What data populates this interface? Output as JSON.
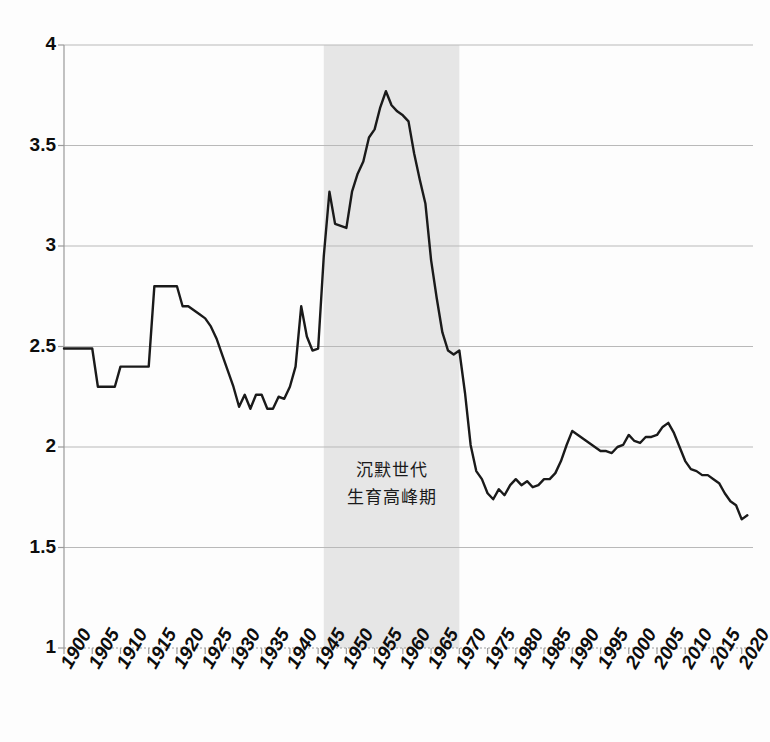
{
  "chart_data": {
    "type": "line",
    "title": "",
    "subtitle": "",
    "xlabel": "",
    "ylabel": "",
    "xlim": [
      1900,
      2022
    ],
    "ylim": [
      1,
      4
    ],
    "ytick_values": [
      1,
      1.5,
      2,
      2.5,
      3,
      3.5,
      4
    ],
    "ytick_labels": [
      "1",
      "1.5",
      "2",
      "2.5",
      "3",
      "3.5",
      "4"
    ],
    "xtick_values": [
      1900,
      1905,
      1910,
      1915,
      1920,
      1925,
      1930,
      1935,
      1940,
      1945,
      1950,
      1955,
      1960,
      1965,
      1970,
      1975,
      1980,
      1985,
      1990,
      1995,
      2000,
      2005,
      2010,
      2015,
      2020
    ],
    "xtick_labels": [
      "1900",
      "1905",
      "1910",
      "1915",
      "1920",
      "1925",
      "1930",
      "1935",
      "1940",
      "1945",
      "1950",
      "1955",
      "1960",
      "1965",
      "1970",
      "1975",
      "1980",
      "1985",
      "1990",
      "1995",
      "2000",
      "2005",
      "2010",
      "2015",
      "2020"
    ],
    "grid": {
      "horizontal": true,
      "vertical": false
    },
    "legend": {
      "show": false,
      "position": "none"
    },
    "line_color": "#1a1a1a",
    "line_width": 2.4,
    "grid_color": "#b9b9b9",
    "axis_color": "#9a9a9a",
    "background_color": "#fdfdfd",
    "shaded_band": {
      "label_lines": [
        "沉默世代",
        "生育高峰期"
      ],
      "x_start": 1946,
      "x_end": 1970,
      "fill_color": "#e6e6e6"
    },
    "series": [
      {
        "name": "total-fertility-rate",
        "x": [
          1900,
          1901,
          1902,
          1903,
          1904,
          1905,
          1906,
          1907,
          1908,
          1909,
          1910,
          1911,
          1912,
          1913,
          1914,
          1915,
          1916,
          1917,
          1918,
          1919,
          1920,
          1921,
          1922,
          1923,
          1924,
          1925,
          1926,
          1927,
          1928,
          1929,
          1930,
          1931,
          1932,
          1933,
          1934,
          1935,
          1936,
          1937,
          1938,
          1939,
          1940,
          1941,
          1942,
          1943,
          1944,
          1945,
          1946,
          1947,
          1948,
          1949,
          1950,
          1951,
          1952,
          1953,
          1954,
          1955,
          1956,
          1957,
          1958,
          1959,
          1960,
          1961,
          1962,
          1963,
          1964,
          1965,
          1966,
          1967,
          1968,
          1969,
          1970,
          1971,
          1972,
          1973,
          1974,
          1975,
          1976,
          1977,
          1978,
          1979,
          1980,
          1981,
          1982,
          1983,
          1984,
          1985,
          1986,
          1987,
          1988,
          1989,
          1990,
          1991,
          1992,
          1993,
          1994,
          1995,
          1996,
          1997,
          1998,
          1999,
          2000,
          2001,
          2002,
          2003,
          2004,
          2005,
          2006,
          2007,
          2008,
          2009,
          2010,
          2011,
          2012,
          2013,
          2014,
          2015,
          2016,
          2017,
          2018,
          2019,
          2020,
          2021
        ],
        "y": [
          2.49,
          2.49,
          2.49,
          2.49,
          2.49,
          2.49,
          2.3,
          2.3,
          2.3,
          2.3,
          2.4,
          2.4,
          2.4,
          2.4,
          2.4,
          2.4,
          2.8,
          2.8,
          2.8,
          2.8,
          2.8,
          2.7,
          2.7,
          2.68,
          2.66,
          2.64,
          2.6,
          2.54,
          2.46,
          2.38,
          2.3,
          2.2,
          2.26,
          2.19,
          2.26,
          2.26,
          2.19,
          2.19,
          2.25,
          2.24,
          2.3,
          2.4,
          2.7,
          2.55,
          2.48,
          2.49,
          2.95,
          3.27,
          3.11,
          3.1,
          3.09,
          3.27,
          3.36,
          3.42,
          3.54,
          3.58,
          3.69,
          3.77,
          3.7,
          3.67,
          3.65,
          3.62,
          3.46,
          3.33,
          3.21,
          2.93,
          2.74,
          2.57,
          2.48,
          2.46,
          2.48,
          2.27,
          2.01,
          1.88,
          1.84,
          1.77,
          1.74,
          1.79,
          1.76,
          1.81,
          1.84,
          1.81,
          1.83,
          1.8,
          1.81,
          1.84,
          1.84,
          1.87,
          1.93,
          2.01,
          2.08,
          2.06,
          2.04,
          2.02,
          2.0,
          1.98,
          1.98,
          1.97,
          2.0,
          2.01,
          2.06,
          2.03,
          2.02,
          2.05,
          2.05,
          2.06,
          2.1,
          2.12,
          2.07,
          2.0,
          1.93,
          1.89,
          1.88,
          1.86,
          1.86,
          1.84,
          1.82,
          1.77,
          1.73,
          1.71,
          1.64,
          1.66
        ]
      }
    ],
    "annotations": [
      {
        "name": "silent-generation-baby-boom-label",
        "lines": [
          "沉默世代",
          "生育高峰期"
        ],
        "x": 1958,
        "y": 1.82
      }
    ],
    "key_points": {
      "baby_boom_peak": {
        "year": 1957,
        "value": 3.77
      },
      "depression_trough": {
        "year": 1933,
        "value": 2.19
      },
      "baby_bust_trough": {
        "year": 1976,
        "value": 1.74
      },
      "echo_peak": {
        "year": 2007,
        "value": 2.12
      },
      "final_value": {
        "year": 2020,
        "value": 1.64
      }
    }
  }
}
